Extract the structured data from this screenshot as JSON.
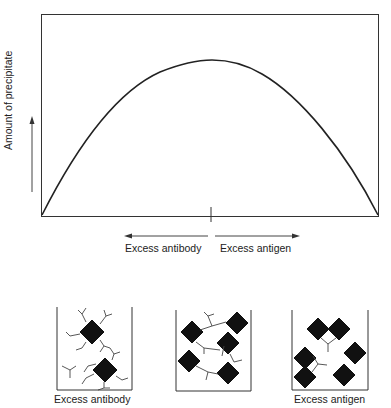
{
  "figure": {
    "y_axis_label": "Amount of precipitate",
    "x_axis_labels": {
      "left": "Excess antibody",
      "right": "Excess antigen"
    },
    "curve": "bell-shaped precipitin curve peaking at equivalence point"
  },
  "beakers": [
    {
      "label": "Excess antibody",
      "description": "Two antigens each surrounded by many antibodies, free antibodies"
    },
    {
      "label": "",
      "description": "Lattice of antigens cross-linked by antibodies (equivalence)"
    },
    {
      "label": "Excess antigen",
      "description": "Small complexes and free antigens"
    }
  ],
  "colors": {
    "line": "#222222",
    "antigen": "#111111",
    "background": "#ffffff"
  }
}
